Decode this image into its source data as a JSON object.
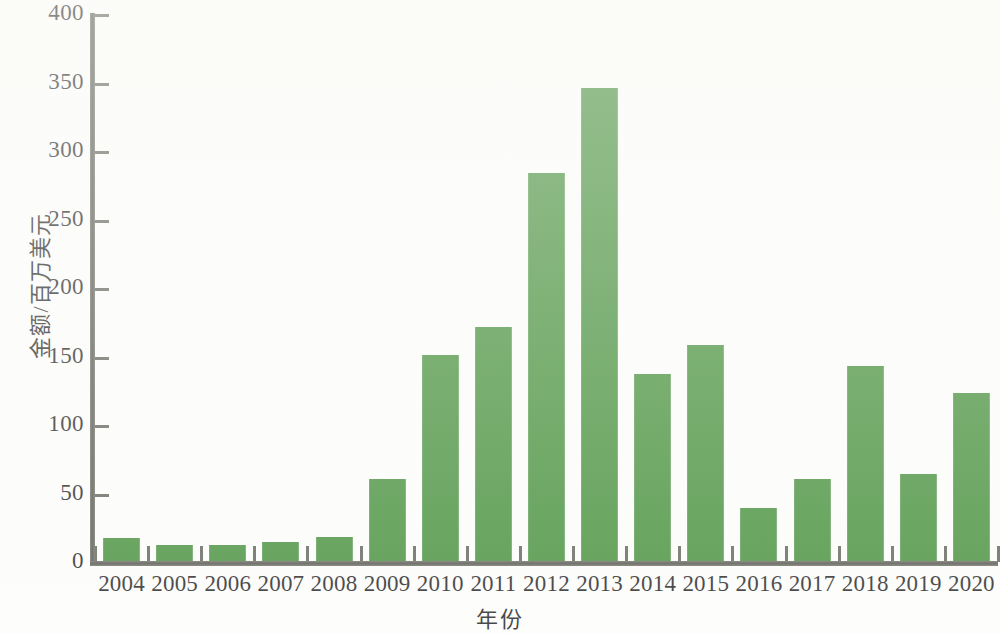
{
  "chart_data": {
    "type": "bar",
    "title": "",
    "subtitle": "",
    "xlabel": "年份",
    "ylabel": "金额/百万美元",
    "categories": [
      "2004",
      "2005",
      "2006",
      "2007",
      "2008",
      "2009",
      "2010",
      "2011",
      "2012",
      "2013",
      "2014",
      "2015",
      "2016",
      "2017",
      "2018",
      "2019",
      "2020"
    ],
    "values": [
      18,
      13,
      13,
      15,
      19,
      61,
      152,
      172,
      285,
      347,
      138,
      159,
      40,
      61,
      144,
      65,
      124
    ],
    "series": [
      {
        "name": "金额",
        "values": [
          18,
          13,
          13,
          15,
          19,
          61,
          152,
          172,
          285,
          347,
          138,
          159,
          40,
          61,
          144,
          65,
          124
        ]
      }
    ],
    "ylim": [
      0,
      400
    ],
    "xlim_categories": 17,
    "yticks": [
      0,
      50,
      100,
      150,
      200,
      250,
      300,
      350,
      400
    ],
    "ytick_labels": [
      "0",
      "50",
      "100",
      "150",
      "200",
      "250",
      "300",
      "350",
      "400"
    ],
    "grid": false,
    "legend": false,
    "legend_position": "none",
    "bar_color": "#3c8a31",
    "axis_color": "#56564f",
    "text_color": "#1a1a1a",
    "background_color": "#ffffff"
  }
}
